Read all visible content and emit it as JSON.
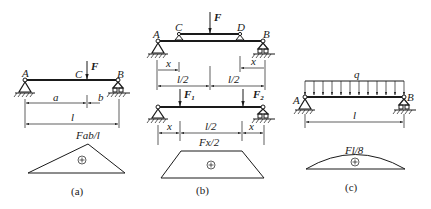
{
  "panels": {
    "a": {
      "caption": "(a)",
      "labels": {
        "A": "A",
        "B": "B",
        "C": "C",
        "F": "F",
        "a": "a",
        "b": "b",
        "l": "l"
      },
      "moment_label": "Fab/l",
      "sign": "+"
    },
    "b": {
      "caption": "(b)",
      "top": {
        "labels": {
          "A": "A",
          "B": "B",
          "C": "C",
          "D": "D",
          "F": "F",
          "x_left": "x",
          "x_right": "x",
          "half_left": "l/2",
          "half_right": "l/2"
        }
      },
      "bottom": {
        "labels": {
          "F1": "F",
          "F1_sub": "1",
          "F2": "F",
          "F2_sub": "2",
          "x_left": "x",
          "x_right": "x",
          "half": "l/2"
        }
      },
      "moment_label": "Fx/2",
      "sign": "+"
    },
    "c": {
      "caption": "(c)",
      "labels": {
        "A": "A",
        "B": "B",
        "q": "q",
        "l": "l"
      },
      "moment_label": "Fl/8",
      "sign": "+"
    }
  }
}
